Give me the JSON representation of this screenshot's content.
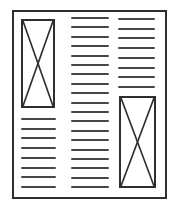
{
  "canvas": {
    "width": 187,
    "height": 210,
    "background": "#ffffff"
  },
  "page": {
    "x": 12,
    "y": 10,
    "width": 155,
    "height": 189,
    "border_color": "#2e2e2e",
    "border_width": 2,
    "background": "#ffffff"
  },
  "style": {
    "text_line_color": "#474747",
    "text_line_thickness": 2,
    "placeholder_border_color": "#2e2e2e",
    "placeholder_border_width": 2,
    "placeholder_cross_color": "#2e2e2e",
    "placeholder_cross_width": 1.6
  },
  "columns": [
    {
      "id": "left",
      "blocks_order": [
        "image",
        "text"
      ]
    },
    {
      "id": "middle",
      "blocks_order": [
        "text"
      ]
    },
    {
      "id": "right",
      "blocks_order": [
        "text",
        "image"
      ]
    }
  ],
  "blocks": [
    {
      "id": "left-image-placeholder",
      "column": "left",
      "type": "image-placeholder",
      "x": 21,
      "y": 19,
      "width": 34,
      "height": 89
    },
    {
      "id": "left-text-lines",
      "column": "left",
      "type": "text-lines",
      "x": 21,
      "y": 118,
      "width": 35,
      "count": 8,
      "spacing": 9.7
    },
    {
      "id": "middle-text-lines",
      "column": "middle",
      "type": "text-lines",
      "x": 71,
      "y": 17,
      "width": 38,
      "count": 19,
      "spacing": 9.4
    },
    {
      "id": "right-text-lines",
      "column": "right",
      "type": "text-lines",
      "x": 118,
      "y": 18,
      "width": 37,
      "count": 8,
      "spacing": 9.7
    },
    {
      "id": "right-image-placeholder",
      "column": "right",
      "type": "image-placeholder",
      "x": 119,
      "y": 96,
      "width": 37,
      "height": 92
    }
  ]
}
